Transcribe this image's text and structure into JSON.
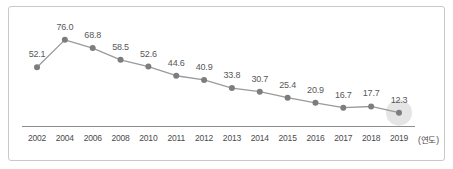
{
  "chart_data": {
    "type": "line",
    "title": "",
    "subtitle": "",
    "xlabel": "(연도)",
    "ylabel": "",
    "categories": [
      "2002",
      "2004",
      "2006",
      "2008",
      "2010",
      "2011",
      "2012",
      "2013",
      "2014",
      "2015",
      "2016",
      "2017",
      "2018",
      "2019"
    ],
    "values": [
      52.1,
      76.0,
      68.8,
      58.5,
      52.6,
      44.6,
      40.9,
      33.8,
      30.7,
      25.4,
      20.9,
      16.7,
      17.7,
      12.3
    ],
    "value_labels": [
      "52.1",
      "76.0",
      "68.8",
      "58.5",
      "52.6",
      "44.6",
      "40.9",
      "33.8",
      "30.7",
      "25.4",
      "20.9",
      "16.7",
      "17.7",
      "12.3"
    ],
    "series": [
      {
        "name": "",
        "values": [
          52.1,
          76.0,
          68.8,
          58.5,
          52.6,
          44.6,
          40.9,
          33.8,
          30.7,
          25.4,
          20.9,
          16.7,
          17.7,
          12.3
        ]
      }
    ],
    "grid": false,
    "legend": false,
    "legend_position": "none",
    "ylim": [
      0,
      90
    ],
    "highlighted_point_index": 13,
    "line_color": "#9a9a9c",
    "marker_color": "#7d7d80",
    "halo_color": "#dcdcdc",
    "axis_color": "#8d8d8f",
    "label_color": "#58585a",
    "frame_color": "#c9c9c9"
  },
  "x_axis": {
    "unit_label": "(연도)"
  }
}
